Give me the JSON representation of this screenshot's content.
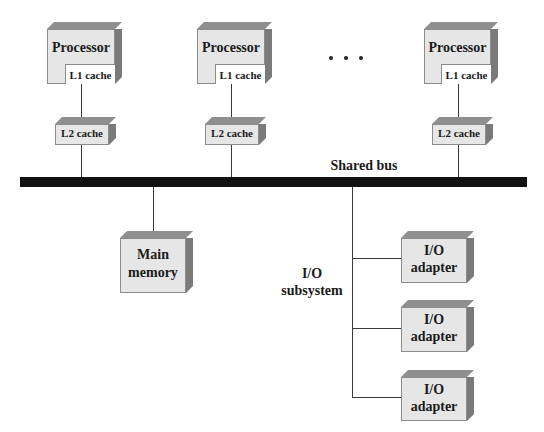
{
  "diagram": {
    "processors": [
      {
        "label": "Processor",
        "l1_label": "L1 cache",
        "l2_label": "L2 cache"
      },
      {
        "label": "Processor",
        "l1_label": "L1 cache",
        "l2_label": "L2 cache"
      },
      {
        "label": "Processor",
        "l1_label": "L1 cache",
        "l2_label": "L2 cache"
      }
    ],
    "ellipsis": "• • •",
    "bus": {
      "label": "Shared bus"
    },
    "memory": {
      "line1": "Main",
      "line2": "memory"
    },
    "io_subsystem": {
      "line1": "I/O",
      "line2": "subsystem"
    },
    "io_adapters": [
      {
        "line1": "I/O",
        "line2": "adapter"
      },
      {
        "line1": "I/O",
        "line2": "adapter"
      },
      {
        "line1": "I/O",
        "line2": "adapter"
      }
    ],
    "colors": {
      "box_front": "#e6e6e6",
      "box_top": "#8f8f8f",
      "box_side": "#7a7a7a",
      "bus": "#111111",
      "connector": "#3a3a3a"
    }
  }
}
